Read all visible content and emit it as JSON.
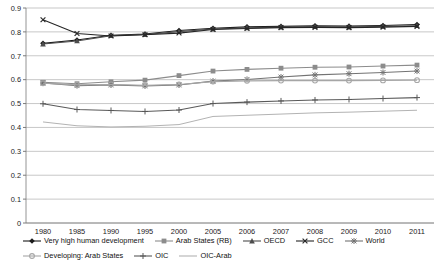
{
  "chart_data": {
    "type": "line",
    "title": "",
    "xlabel": "",
    "ylabel": "",
    "ylim": [
      0,
      0.9
    ],
    "ytick_labels": [
      "0.9",
      "0.8",
      "0.7",
      "0.6",
      "0.5",
      "0.4",
      "0.3",
      "0.2",
      "0.1",
      "0"
    ],
    "ytick_values": [
      0.9,
      0.8,
      0.7,
      0.6,
      0.5,
      0.4,
      0.3,
      0.2,
      0.1,
      0
    ],
    "grid": true,
    "legend_position": "bottom",
    "categories": [
      "1980",
      "1985",
      "1990",
      "1995",
      "2000",
      "2005",
      "2006",
      "2007",
      "2008",
      "2009",
      "2010",
      "2011"
    ],
    "series": [
      {
        "name": "Very high human development",
        "marker": "diamond",
        "color": "#1a1a1a",
        "values": [
          0.752,
          0.766,
          0.786,
          0.791,
          0.806,
          0.815,
          0.821,
          0.823,
          0.826,
          0.824,
          0.827,
          0.831
        ]
      },
      {
        "name": "Arab States (RB)",
        "marker": "square",
        "color": "#8c8c8c",
        "values": [
          0.589,
          0.583,
          0.591,
          0.598,
          0.617,
          0.636,
          0.643,
          0.648,
          0.652,
          0.653,
          0.657,
          0.661
        ]
      },
      {
        "name": "OECD",
        "marker": "triangle",
        "color": "#4d4d4d",
        "values": [
          0.749,
          0.762,
          0.784,
          0.789,
          0.801,
          0.812,
          0.817,
          0.82,
          0.822,
          0.82,
          0.823,
          0.826
        ]
      },
      {
        "name": "GCC",
        "marker": "cross-x",
        "color": "#262626",
        "values": [
          0.851,
          0.793,
          0.783,
          0.788,
          0.795,
          0.81,
          0.814,
          0.818,
          0.819,
          0.818,
          0.82,
          0.823
        ]
      },
      {
        "name": "World",
        "marker": "star",
        "color": "#737373",
        "values": [
          0.586,
          0.575,
          0.578,
          0.574,
          0.578,
          0.594,
          0.601,
          0.611,
          0.62,
          0.625,
          0.63,
          0.636
        ]
      },
      {
        "name": "Developing: Arab States",
        "marker": "circle",
        "color": "#a6a6a6",
        "values": [
          0.585,
          0.578,
          0.58,
          0.576,
          0.58,
          0.592,
          0.595,
          0.596,
          0.596,
          0.596,
          0.597,
          0.598
        ]
      },
      {
        "name": "OIC",
        "marker": "plus",
        "color": "#595959",
        "values": [
          0.499,
          0.475,
          0.471,
          0.467,
          0.473,
          0.5,
          0.506,
          0.511,
          0.515,
          0.517,
          0.521,
          0.525
        ]
      },
      {
        "name": "OIC-Arab",
        "marker": "none",
        "color": "#b3b3b3",
        "values": [
          0.423,
          0.407,
          0.402,
          0.405,
          0.412,
          0.446,
          0.451,
          0.456,
          0.461,
          0.464,
          0.468,
          0.472
        ]
      }
    ]
  },
  "legend": {
    "row1": [
      {
        "label": "Very high human development"
      },
      {
        "label": "Arab States (RB)"
      },
      {
        "label": "OECD"
      },
      {
        "label": "GCC"
      },
      {
        "label": "World"
      }
    ],
    "row2": [
      {
        "label": "Developing: Arab States"
      },
      {
        "label": "OIC"
      },
      {
        "label": "OIC-Arab"
      }
    ]
  }
}
